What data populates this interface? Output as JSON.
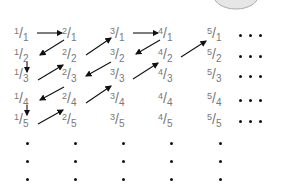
{
  "diagram": {
    "columns": [
      1,
      2,
      3,
      4,
      5
    ],
    "rows": [
      1,
      2,
      3,
      4,
      5
    ],
    "col_x": [
      14,
      62,
      110,
      158,
      207
    ],
    "row_y": [
      26,
      47,
      67,
      91,
      112
    ],
    "fractions": [
      [
        "1/1",
        "2/1",
        "3/1",
        "4/1",
        "5/1"
      ],
      [
        "1/2",
        "2/2",
        "3/2",
        "4/2",
        "5/2"
      ],
      [
        "1/3",
        "2/3",
        "3/3",
        "4/3",
        "5/3"
      ],
      [
        "1/4",
        "2/4",
        "3/4",
        "4/4",
        "5/4"
      ],
      [
        "1/5",
        "2/5",
        "3/5",
        "4/5",
        "5/5"
      ]
    ],
    "path": [
      "1/1",
      "2/1",
      "1/2",
      "1/3",
      "2/2",
      "3/1",
      "4/1",
      "3/2",
      "2/3",
      "1/4",
      "1/5",
      "2/4",
      "3/3",
      "4/2",
      "5/1"
    ],
    "arrows": [
      {
        "from": [
          37,
          33
        ],
        "to": [
          62,
          33
        ]
      },
      {
        "from": [
          64,
          40
        ],
        "to": [
          40,
          55
        ]
      },
      {
        "from": [
          27,
          62
        ],
        "to": [
          27,
          72
        ]
      },
      {
        "from": [
          38,
          80
        ],
        "to": [
          63,
          65
        ]
      },
      {
        "from": [
          86,
          55
        ],
        "to": [
          111,
          38
        ]
      },
      {
        "from": [
          133,
          33
        ],
        "to": [
          158,
          33
        ]
      },
      {
        "from": [
          160,
          40
        ],
        "to": [
          136,
          54
        ]
      },
      {
        "from": [
          111,
          62
        ],
        "to": [
          86,
          76
        ]
      },
      {
        "from": [
          64,
          87
        ],
        "to": [
          40,
          100
        ]
      },
      {
        "from": [
          27,
          105
        ],
        "to": [
          27,
          115
        ]
      },
      {
        "from": [
          38,
          124
        ],
        "to": [
          63,
          110
        ]
      },
      {
        "from": [
          86,
          103
        ],
        "to": [
          111,
          86
        ]
      },
      {
        "from": [
          133,
          79
        ],
        "to": [
          158,
          63
        ]
      },
      {
        "from": [
          181,
          57
        ],
        "to": [
          206,
          41
        ]
      }
    ],
    "ellipsis_right_rows": [
      0,
      1,
      2,
      3,
      4
    ],
    "ellipsis_down_rows_y": [
      142,
      160,
      178
    ],
    "colors": {
      "text": "#777777",
      "arrow": "#111111",
      "dots": "#111111",
      "circle_fill": "#e6e6e6",
      "circle_stroke": "#aaaaaa"
    }
  }
}
